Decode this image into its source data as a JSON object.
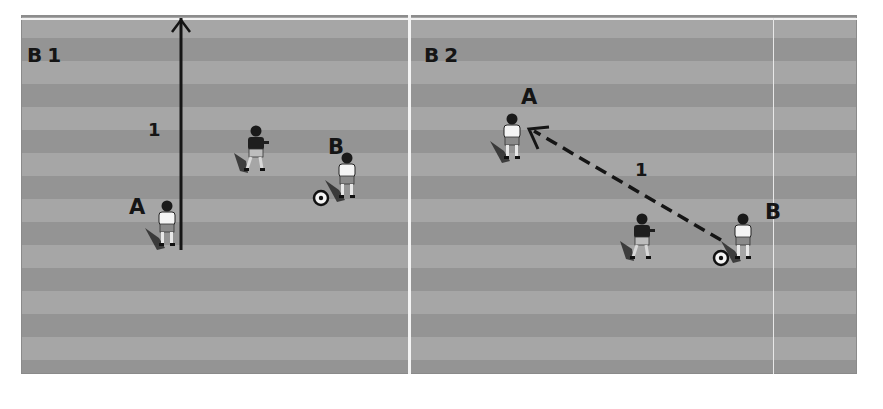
{
  "diagrams": [
    {
      "id": "b1",
      "label": "B1",
      "step_label": "1",
      "players": [
        {
          "label": "A",
          "team": "white"
        },
        {
          "label": "",
          "team": "dark"
        },
        {
          "label": "B",
          "team": "white",
          "has_ball": true
        }
      ],
      "movement": {
        "type": "run",
        "style": "solid-arrow",
        "from": "A",
        "direction": "up"
      }
    },
    {
      "id": "b2",
      "label": "B2",
      "step_label": "1",
      "players": [
        {
          "label": "A",
          "team": "white"
        },
        {
          "label": "",
          "team": "dark"
        },
        {
          "label": "B",
          "team": "white",
          "has_ball": true
        }
      ],
      "movement": {
        "type": "pass",
        "style": "dashed-arrow",
        "from": "B",
        "to": "A"
      }
    }
  ],
  "colors": {
    "field_light": "#a6a6a6",
    "field_dark": "#949494",
    "lines": "#f4f4f4",
    "ink": "#151515"
  }
}
